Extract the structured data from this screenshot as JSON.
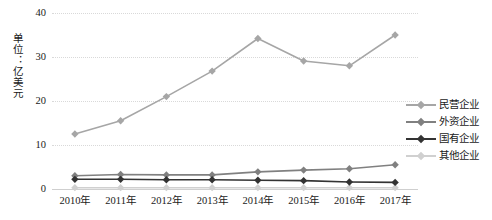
{
  "chart_data": {
    "type": "line",
    "title": "",
    "xlabel": "",
    "ylabel": "单位：亿美元",
    "categories": [
      "2010年",
      "2011年",
      "2012年",
      "2013年",
      "2014年",
      "2015年",
      "2016年",
      "2017年"
    ],
    "ylim": [
      0,
      40
    ],
    "yticks": [
      0,
      10,
      20,
      30,
      40
    ],
    "ytick_labels": [
      "0",
      "10",
      "20",
      "30",
      "40"
    ],
    "grid": true,
    "legend_position": "right",
    "series": [
      {
        "name": "民营企业",
        "color": "#a6a6a6",
        "values": [
          12.5,
          15.5,
          21.0,
          26.8,
          34.2,
          29.1,
          28.0,
          35.0
        ]
      },
      {
        "name": "外资企业",
        "color": "#808080",
        "values": [
          3.0,
          3.3,
          3.2,
          3.2,
          3.9,
          4.3,
          4.6,
          5.5
        ]
      },
      {
        "name": "国有企业",
        "color": "#333333",
        "values": [
          2.2,
          2.2,
          2.1,
          2.1,
          2.0,
          1.9,
          1.6,
          1.5
        ]
      },
      {
        "name": "其他企业",
        "color": "#d0d0d0",
        "values": [
          0.3,
          0.3,
          0.3,
          0.3,
          0.3,
          0.3,
          0.3,
          0.3
        ]
      }
    ]
  },
  "legend": {
    "items": [
      {
        "label": "民营企业"
      },
      {
        "label": "外资企业"
      },
      {
        "label": "国有企业"
      },
      {
        "label": "其他企业"
      }
    ]
  },
  "colors": {
    "background": "#ffffff",
    "gridline": "#d9d9d9",
    "axis": "#cfcfcf",
    "text": "#1a1a1a"
  }
}
